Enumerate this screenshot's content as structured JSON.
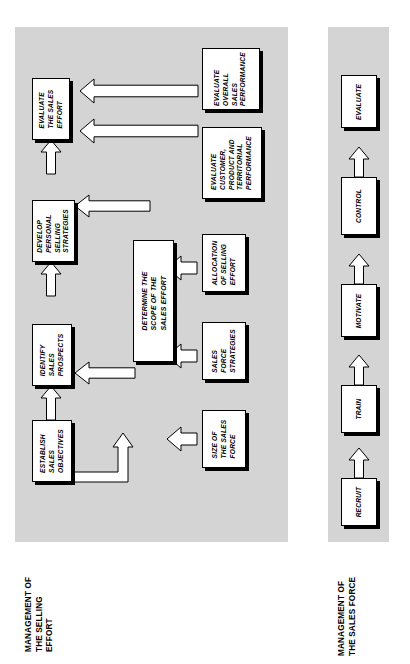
{
  "diagram": {
    "title_not_shown": "",
    "panels": [
      {
        "id": "selling",
        "caption": "MANAGEMENT OF\nTHE SELLING\nEFFORT",
        "background": "#d4d4d4"
      },
      {
        "id": "salesforce",
        "caption": "MANAGEMENT OF\nTHE SALES FORCE",
        "background": "#d4d4d4"
      }
    ],
    "selling_nodes": [
      {
        "id": "evaluate-the-sales-effort",
        "label": "EVALUATE\nTHE SALES\nEFFORT"
      },
      {
        "id": "develop-personal-selling-strategies",
        "label": "DEVELOP\nPERSONAL\nSELLING\nSTRATEGIES"
      },
      {
        "id": "identify-sales-prospects",
        "label": "IDENTIFY\nSALES\nPROSPECTS"
      },
      {
        "id": "establish-sales-objectives",
        "label": "ESTABLISH\nSALES\nOBJECTIVES"
      },
      {
        "id": "determine-the-scope-of-the-sales-effort",
        "label": "DETERMINE THE\nSCOPE OF THE\nSALES EFFORT"
      },
      {
        "id": "evaluate-overall-sales-performance",
        "label": "EVALUATE\nOVERALL\nSALES\nPERFORMANCE"
      },
      {
        "id": "evaluate-customer-product-and-territorial-performance",
        "label": "EVALUATE\nCUSTOMER,\nPRODUCT AND\nTERRITORIAL\nPERFORMANCE"
      },
      {
        "id": "allocation-of-selling-effort",
        "label": "ALLOCATION\nOF SELLING\nEFFORT"
      },
      {
        "id": "sales-force-strategies",
        "label": "SALES\nFORCE\nSTRATEGIES"
      },
      {
        "id": "size-of-the-sales-force",
        "label": "SIZE OF\nTHE SALES\nFORCE"
      }
    ],
    "salesforce_nodes": [
      {
        "id": "recruit",
        "label": "RECRUIT"
      },
      {
        "id": "train",
        "label": "TRAIN"
      },
      {
        "id": "motivate",
        "label": "MOTIVATE"
      },
      {
        "id": "control",
        "label": "CONTROL"
      },
      {
        "id": "evaluate",
        "label": "EVALUATE"
      }
    ],
    "colors": {
      "panel": "#d4d4d4",
      "node_fill": "#ffffff",
      "node_shadow": "#000000",
      "stroke": "#000000"
    }
  }
}
